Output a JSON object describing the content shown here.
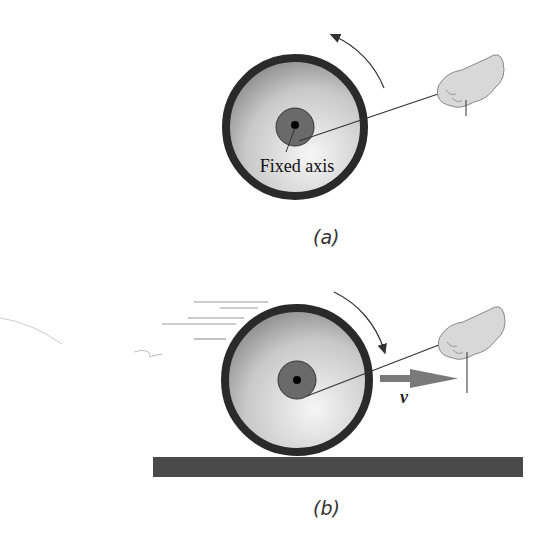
{
  "panel_a": {
    "caption": "(a)",
    "axis_label": "Fixed axis",
    "rotation": "counterclockwise"
  },
  "panel_b": {
    "caption": "(b)",
    "velocity_label": "v",
    "rotation": "clockwise"
  },
  "colors": {
    "rim": "#2a2a2a",
    "hub": "#666666",
    "ground": "#4a4a4a",
    "arrow": "#7a7a7a"
  }
}
